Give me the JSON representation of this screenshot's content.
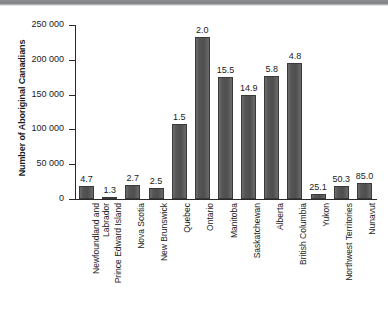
{
  "chart_data": {
    "type": "bar",
    "title": "",
    "xlabel": "",
    "ylabel": "Number of Aboriginal Canadians",
    "ylim": [
      0,
      250000
    ],
    "ytick_step": 50000,
    "grid": false,
    "legend": null,
    "bar_color": "#565656",
    "axis_color": "#2a2a2a",
    "categories": [
      "Newfoundland and Labrador",
      "Prince Edward Island",
      "Nova Scotia",
      "New Brunswick",
      "Quebec",
      "Ontario",
      "Manitoba",
      "Saskatchewan",
      "Alberta",
      "British Columbia",
      "Yukon",
      "Northwest Territories",
      "Nunavut"
    ],
    "values": [
      18800,
      1300,
      20700,
      16500,
      108400,
      242000,
      175400,
      149000,
      176300,
      196100,
      7600,
      18500,
      22700
    ],
    "data_labels": [
      "4.7",
      "1.3",
      "2.7",
      "2.5",
      "1.5",
      "2.0",
      "15.5",
      "14.9",
      "5.8",
      "4.8",
      "25.1",
      "50.3",
      "85.0"
    ],
    "ytick_labels": [
      "0",
      "50 000",
      "100 000",
      "150 000",
      "200 000",
      "250 000"
    ],
    "ytick_values": [
      0,
      50000,
      100000,
      150000,
      200000,
      250000
    ]
  },
  "category_lines": [
    [
      "Newfoundland and",
      "Labrador"
    ],
    [
      "Prince Edward Island"
    ],
    [
      "Nova Scotia"
    ],
    [
      "New Brunswick"
    ],
    [
      "Quebec"
    ],
    [
      "Ontario"
    ],
    [
      "Manitoba"
    ],
    [
      "Saskatchewan"
    ],
    [
      "Alberta"
    ],
    [
      "British Columbia"
    ],
    [
      "Yukon"
    ],
    [
      "Northwest Territories"
    ],
    [
      "Nunavut"
    ]
  ]
}
